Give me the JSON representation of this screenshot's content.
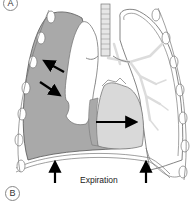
{
  "figure": {
    "panel_labels": {
      "top": "A",
      "bottom": "B"
    },
    "caption": "Expiration",
    "colors": {
      "collapsed_space": "#a9a9a9",
      "lung_outline": "#666666",
      "bronchi": "#dcdcdc",
      "heart": "#d9d9d9",
      "arrow": "#000000",
      "rib": "#ffffff"
    },
    "elements": [
      "trachea",
      "left-hemithorax-shaded-space",
      "collapsed-left-lung",
      "right-lung-with-bronchial-tree",
      "heart",
      "diaphragm",
      "ribs"
    ],
    "arrows": [
      {
        "name": "arrow-up-left",
        "direction": "up-left"
      },
      {
        "name": "arrow-down-right",
        "direction": "down-right"
      },
      {
        "name": "arrow-mediastinal-shift-right",
        "direction": "right"
      },
      {
        "name": "arrow-diaphragm-left-up",
        "direction": "up"
      },
      {
        "name": "arrow-diaphragm-right-up",
        "direction": "up"
      }
    ]
  }
}
